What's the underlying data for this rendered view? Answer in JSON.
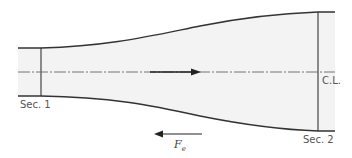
{
  "diagram": {
    "type": "diverging-duct-control-volume",
    "labels": {
      "section1": "Sec. 1",
      "section2": "Sec. 2",
      "centerline": "C.L.",
      "force_symbol": "F",
      "force_subscript": "e"
    },
    "flow_direction": "left-to-right",
    "force_direction": "right-to-left",
    "colors": {
      "wall": "#333333",
      "fill": "#f3f3f3",
      "centerline": "#555555",
      "arrow": "#222222",
      "text": "#555555"
    }
  }
}
